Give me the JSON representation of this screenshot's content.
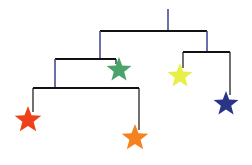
{
  "colors": {
    "background": "#ffffff",
    "bar": "#111111",
    "hook": "#3b3f8f"
  },
  "stars": [
    {
      "name": "red-star",
      "color": "#f0401a",
      "cx": 28,
      "cy": 120,
      "r": 14
    },
    {
      "name": "orange-star",
      "color": "#f5821f",
      "cx": 135,
      "cy": 138,
      "r": 14
    },
    {
      "name": "green-star",
      "color": "#4aa36a",
      "cx": 119,
      "cy": 70,
      "r": 13
    },
    {
      "name": "yellow-star",
      "color": "#e8ef45",
      "cx": 180,
      "cy": 76,
      "r": 13
    },
    {
      "name": "navy-star",
      "color": "#2b3588",
      "cx": 226,
      "cy": 104,
      "r": 13
    }
  ]
}
